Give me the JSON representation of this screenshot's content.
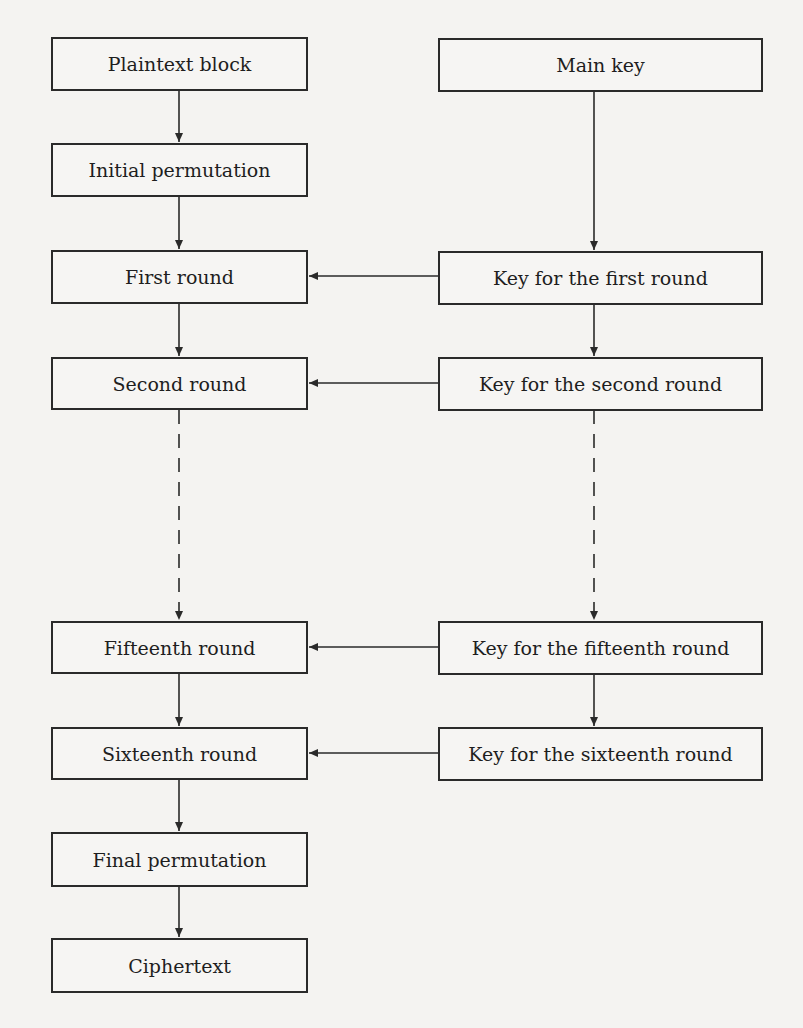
{
  "diagram": {
    "title": "",
    "left_column": [
      {
        "id": "plaintext",
        "label": "Plaintext block"
      },
      {
        "id": "initial-permutation",
        "label": "Initial permutation"
      },
      {
        "id": "round-1",
        "label": "First round"
      },
      {
        "id": "round-2",
        "label": "Second round"
      },
      {
        "id": "round-15",
        "label": "Fifteenth round"
      },
      {
        "id": "round-16",
        "label": "Sixteenth round"
      },
      {
        "id": "final-permutation",
        "label": "Final permutation"
      },
      {
        "id": "ciphertext",
        "label": "Ciphertext"
      }
    ],
    "right_column": [
      {
        "id": "main-key",
        "label": "Main key"
      },
      {
        "id": "key-1",
        "label": "Key for the first round"
      },
      {
        "id": "key-2",
        "label": "Key for the second round"
      },
      {
        "id": "key-15",
        "label": "Key for the fifteenth round"
      },
      {
        "id": "key-16",
        "label": "Key for the sixteenth round"
      }
    ],
    "edges": [
      {
        "from": "plaintext",
        "to": "initial-permutation",
        "style": "solid"
      },
      {
        "from": "initial-permutation",
        "to": "round-1",
        "style": "solid"
      },
      {
        "from": "round-1",
        "to": "round-2",
        "style": "solid"
      },
      {
        "from": "round-2",
        "to": "round-15",
        "style": "dashed"
      },
      {
        "from": "round-15",
        "to": "round-16",
        "style": "solid"
      },
      {
        "from": "round-16",
        "to": "final-permutation",
        "style": "solid"
      },
      {
        "from": "final-permutation",
        "to": "ciphertext",
        "style": "solid"
      },
      {
        "from": "main-key",
        "to": "key-1",
        "style": "solid"
      },
      {
        "from": "key-1",
        "to": "key-2",
        "style": "solid"
      },
      {
        "from": "key-2",
        "to": "key-15",
        "style": "dashed"
      },
      {
        "from": "key-15",
        "to": "key-16",
        "style": "solid"
      },
      {
        "from": "key-1",
        "to": "round-1",
        "style": "solid"
      },
      {
        "from": "key-2",
        "to": "round-2",
        "style": "solid"
      },
      {
        "from": "key-15",
        "to": "round-15",
        "style": "solid"
      },
      {
        "from": "key-16",
        "to": "round-16",
        "style": "solid"
      }
    ],
    "colors": {
      "line": "#2a2a2a",
      "background": "#f4f3f1"
    }
  }
}
